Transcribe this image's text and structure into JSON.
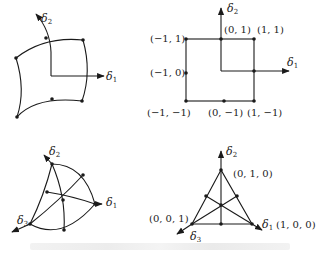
{
  "panels": {
    "top_left": {
      "title": "curved quadrilateral element",
      "axis_labels": {
        "d1": "δ",
        "d1_sub": "1",
        "d2": "δ",
        "d2_sub": "2"
      }
    },
    "top_right": {
      "title": "reference square",
      "axis_labels": {
        "d1": "δ",
        "d1_sub": "1",
        "d2": "δ",
        "d2_sub": "2"
      },
      "node_labels": {
        "n_m1_1": "(−1, 1)",
        "n_0_1": "(0, 1)",
        "n_1_1": "(1, 1)",
        "n_m1_0": "(−1, 0)",
        "n_m1_m1": "(−1, −1)",
        "n_0_m1": "(0, −1)",
        "n_1_m1": "(1, −1)"
      }
    },
    "bottom_left": {
      "title": "curved triangular element",
      "axis_labels": {
        "d1": "δ",
        "d1_sub": "1",
        "d2": "δ",
        "d2_sub": "2",
        "d3": "δ",
        "d3_sub": "3"
      }
    },
    "bottom_right": {
      "title": "reference triangle",
      "axis_labels": {
        "d1": "δ",
        "d1_sub": "1",
        "d2": "δ",
        "d2_sub": "2",
        "d3": "δ",
        "d3_sub": "3"
      },
      "node_labels": {
        "n_010": "(0, 1, 0)",
        "n_001": "(0, 0, 1)",
        "n_100": "(1, 0, 0)"
      }
    }
  },
  "colors": {
    "stroke": "#1a1a1a",
    "text": "#222222",
    "caption": "#eeeeee"
  }
}
